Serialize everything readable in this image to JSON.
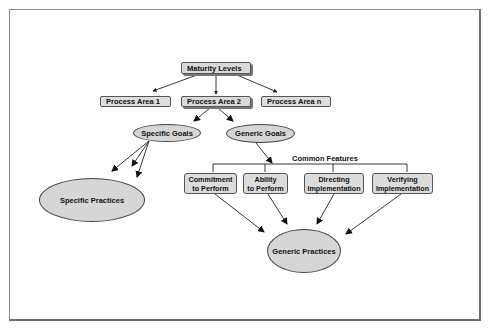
{
  "diagram": {
    "title": "",
    "nodes": {
      "maturity_levels": "Maturity Levels",
      "process_area_1": "Process Area 1",
      "process_area_2": "Process Area 2",
      "process_area_n": "Process Area n",
      "specific_goals": "Specific Goals",
      "generic_goals": "Generic Goals",
      "specific_practices": "Specific Practices",
      "common_features_label": "Common  Features",
      "features": [
        {
          "line1": "Commitment",
          "line2": "to Perform"
        },
        {
          "line1": "Ability",
          "line2": "to Perform"
        },
        {
          "line1": "Directing",
          "line2": "Implementation"
        },
        {
          "line1": "Verifying",
          "line2": "Implementation"
        }
      ],
      "generic_practices": "Generic Practices"
    },
    "edges": [
      [
        "Maturity Levels",
        "Process Area 1"
      ],
      [
        "Maturity Levels",
        "Process Area 2"
      ],
      [
        "Maturity Levels",
        "Process Area n"
      ],
      [
        "Process Area 2",
        "Specific Goals"
      ],
      [
        "Process Area 2",
        "Generic Goals"
      ],
      [
        "Specific Goals",
        "Specific Practices"
      ],
      [
        "Generic Goals",
        "Common Features"
      ],
      [
        "Commitment to Perform",
        "Generic Practices"
      ],
      [
        "Ability to Perform",
        "Generic Practices"
      ],
      [
        "Directing Implementation",
        "Generic Practices"
      ],
      [
        "Verifying Implementation",
        "Generic Practices"
      ]
    ],
    "colors": {
      "node_fill": "#d9d9d9",
      "stroke": "#333333",
      "background": "#ffffff"
    }
  }
}
